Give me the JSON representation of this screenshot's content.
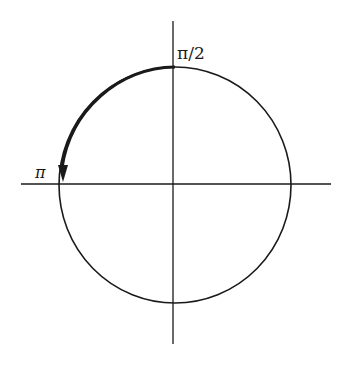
{
  "diagram": {
    "type": "unit-circle",
    "labels": {
      "top": "π/2",
      "left": "π"
    },
    "arc": {
      "from": "π/2",
      "to": "π",
      "direction": "counterclockwise"
    },
    "colors": {
      "stroke": "#1a1a1a",
      "background": "#ffffff"
    }
  }
}
